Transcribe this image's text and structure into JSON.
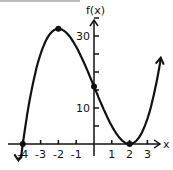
{
  "chart_data": {
    "type": "line",
    "title": "",
    "function": "f(x) = (x+4)(x-2)^2",
    "xlabel": "x",
    "ylabel": "f(x)",
    "xlim": [
      -4.3,
      4.3
    ],
    "ylim": [
      -3,
      36
    ],
    "x_ticks": [
      -4,
      -3,
      -2,
      -1,
      1,
      2,
      3
    ],
    "x_tick_labels": [
      "-4",
      "-3",
      "-2",
      "-1",
      "1",
      "2",
      "3"
    ],
    "y_ticks": [
      5,
      10,
      15,
      20,
      25,
      30,
      35
    ],
    "y_tick_labels": [
      "10",
      "30"
    ],
    "grid": false,
    "points": [
      {
        "x": -4,
        "y": 0
      },
      {
        "x": -2,
        "y": 32
      },
      {
        "x": 0,
        "y": 16
      },
      {
        "x": 2,
        "y": 0
      }
    ],
    "color": "#111111"
  }
}
